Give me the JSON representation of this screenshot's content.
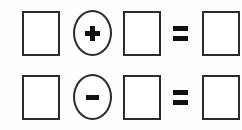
{
  "worksheet": {
    "title": "Arithmetic equation frames worksheet",
    "background_color": "#fdfdfd",
    "stroke_color": "#2b2b2b",
    "glyph_color": "#111111",
    "rows": [
      {
        "id": "row-0",
        "operator": "+",
        "operator_name": "plus-operator",
        "equals": "=",
        "operand_1": "",
        "operand_2": "",
        "result": ""
      },
      {
        "id": "row-1",
        "operator": "-",
        "operator_name": "minus-operator",
        "equals": "=",
        "operand_1": "",
        "operand_2": "",
        "result": ""
      }
    ]
  }
}
